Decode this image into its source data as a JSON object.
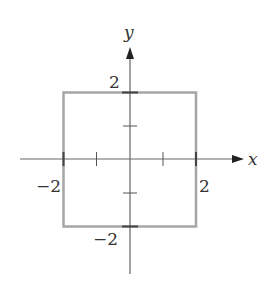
{
  "diagram": {
    "type": "coordinate-plane-square",
    "axes": {
      "x_label": "x",
      "y_label": "y",
      "axis_color": "#555555"
    },
    "square": {
      "x_min": -2,
      "x_max": 2,
      "y_min": -2,
      "y_max": 2,
      "stroke_color": "#a6a6a6"
    },
    "tick_labels": {
      "x_neg": "−2",
      "x_pos": "2",
      "y_pos": "2",
      "y_neg": "−2"
    },
    "ticks": [
      -2,
      -1,
      1,
      2
    ]
  }
}
